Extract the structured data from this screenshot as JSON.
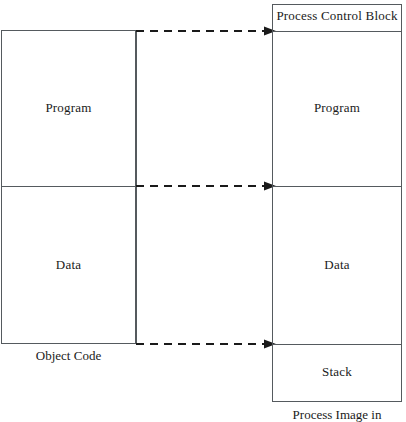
{
  "diagram": {
    "line_color": "#555a5e",
    "background_color": "#ffffff",
    "text_color": "#1a1a1a"
  },
  "object_code": {
    "caption": "Object Code",
    "segments": [
      {
        "label": "Program"
      },
      {
        "label": "Data"
      }
    ]
  },
  "process_image": {
    "caption": "Process Image in",
    "segments": [
      {
        "label": "Process Control Block"
      },
      {
        "label": "Program"
      },
      {
        "label": "Data"
      },
      {
        "label": "Stack"
      }
    ]
  },
  "connectors": [
    {
      "name": "program-start-mapping",
      "style": "dashed-arrow"
    },
    {
      "name": "data-start-mapping",
      "style": "dashed-arrow"
    },
    {
      "name": "data-end-mapping",
      "style": "dashed-arrow"
    }
  ]
}
